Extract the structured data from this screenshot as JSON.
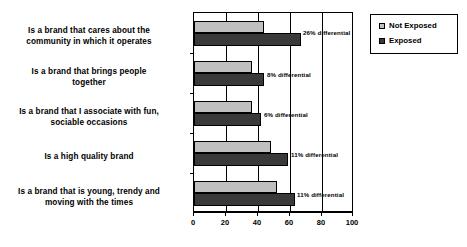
{
  "chart_data": {
    "type": "bar",
    "orientation": "horizontal",
    "title": "",
    "xlabel": "",
    "ylabel": "",
    "xlim": [
      0,
      100
    ],
    "xticks": [
      0,
      20,
      40,
      60,
      80,
      100
    ],
    "grid": true,
    "legend_position": "top-right",
    "categories": [
      "Is a brand that cares about the community in which it operates",
      "Is a brand that brings people together",
      "Is a brand that I associate with fun, sociable occasions",
      "Is a high quality brand",
      "Is a brand that is young, trendy and moving with the times"
    ],
    "category_lines": [
      [
        "Is a brand that cares about the",
        "community in which it operates"
      ],
      [
        "Is a brand that brings people",
        "together"
      ],
      [
        "Is a brand that I associate with fun,",
        "sociable occasions"
      ],
      [
        "Is a high quality brand"
      ],
      [
        "Is a brand that is young, trendy and",
        "moving with the times"
      ]
    ],
    "series": [
      {
        "name": "Not Exposed",
        "color": "#bfbfbf",
        "values": [
          44,
          36,
          36,
          48,
          52
        ]
      },
      {
        "name": "Exposed",
        "color": "#3a3a3a",
        "values": [
          67,
          44,
          42,
          59,
          63
        ]
      }
    ],
    "annotations": [
      "26% differential",
      "8% differential",
      "6% differential",
      "11% differential",
      "11% differential"
    ]
  },
  "legend": {
    "items": [
      {
        "label": "Not Exposed",
        "color": "#bfbfbf"
      },
      {
        "label": "Exposed",
        "color": "#3a3a3a"
      }
    ]
  },
  "axis": {
    "tick_labels": [
      "0",
      "20",
      "40",
      "60",
      "80",
      "100"
    ]
  }
}
